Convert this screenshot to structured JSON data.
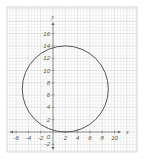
{
  "chart_data": {
    "type": "line",
    "title": "",
    "xlabel": "x",
    "ylabel": "y",
    "xlim": [
      -7,
      11
    ],
    "ylim": [
      -3,
      18
    ],
    "grid": true,
    "x_ticks": [
      -6,
      -4,
      -2,
      2,
      4,
      6,
      8,
      10
    ],
    "y_ticks": [
      -2,
      2,
      4,
      6,
      8,
      10,
      12,
      14,
      16
    ],
    "origin_label": "0",
    "series": [
      {
        "name": "circle",
        "shape": "circle",
        "center": [
          2,
          7
        ],
        "radius": 7,
        "color": "#555555"
      }
    ]
  }
}
